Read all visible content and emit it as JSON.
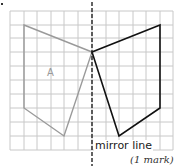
{
  "diagram": {
    "grid": {
      "x_lines": [
        10,
        24,
        37,
        51,
        64,
        78,
        92,
        106,
        119,
        133,
        146,
        160,
        173
      ],
      "y_lines": [
        11,
        25,
        38,
        52,
        66,
        80,
        94,
        108,
        122,
        136,
        150
      ],
      "color": "#c8c8c8"
    },
    "mirror_line": {
      "x": 92,
      "y_top": 2,
      "y_bottom": 166,
      "color": "#222222",
      "label": "mirror line"
    },
    "shape_a": {
      "label": "A",
      "color": "#9a9a9a",
      "points": [
        [
          24,
          25
        ],
        [
          92,
          52
        ],
        [
          64,
          136
        ],
        [
          24,
          108
        ]
      ]
    },
    "reflection": {
      "color": "#111111",
      "points": [
        [
          160,
          25
        ],
        [
          92,
          52
        ],
        [
          119,
          136
        ],
        [
          160,
          108
        ]
      ]
    },
    "marks_text": "(1 mark)"
  }
}
